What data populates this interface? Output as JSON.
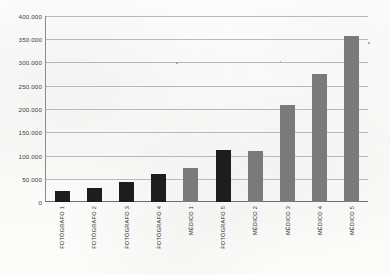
{
  "chart_data": {
    "type": "bar",
    "title": "",
    "subtitle": "",
    "xlabel": "",
    "ylabel": "",
    "ylim": [
      0,
      400000
    ],
    "grid": true,
    "legend": "none",
    "ytick_labels": [
      "400.000",
      "350.000",
      "300.000",
      "250.000",
      "200.000",
      "150.000",
      "100.000",
      "50.000",
      "0"
    ],
    "ytick_values": [
      400000,
      350000,
      300000,
      250000,
      200000,
      150000,
      100000,
      50000,
      0
    ],
    "categories": [
      "FOTÓGRAFO 1",
      "FOTÓGRAFO 2",
      "FOTÓGRAFO 3",
      "FOTÓGRAFO 4",
      "MÉDICO 1",
      "FOTÓGRAFO 5",
      "MÉDICO 2",
      "MÉDICO 3",
      "MÉDICO 4",
      "MÉDICO 5"
    ],
    "values": [
      24000,
      31000,
      42000,
      60000,
      74000,
      112000,
      110000,
      208000,
      275000,
      357000
    ],
    "groups": [
      "fotografo",
      "fotografo",
      "fotografo",
      "fotografo",
      "medico",
      "fotografo",
      "medico",
      "medico",
      "medico",
      "medico"
    ],
    "colors": {
      "fotografo": "#1d1d1d",
      "medico": "#7a7a7a",
      "gridline": "#b9b9b9",
      "axis": "#6e6e6e",
      "tick_text": "#3d3d3d",
      "background": "#fbfbfa"
    }
  }
}
